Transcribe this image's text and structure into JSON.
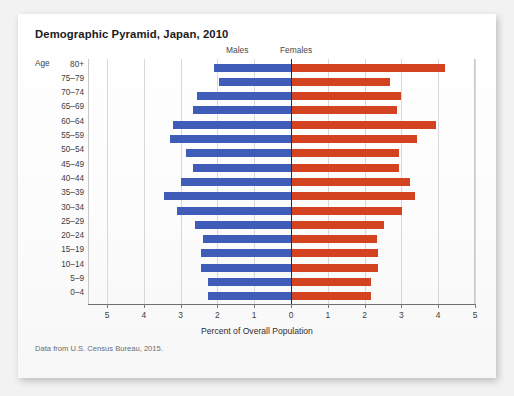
{
  "figure": {
    "title": "Demographic Pyramid, Japan, 2010",
    "source_note": "Data from U.S. Census Bureau, 2015.",
    "age_axis_title": "Age",
    "legend_left": "Males",
    "legend_right": "Females",
    "color_male": "#3f5cb8",
    "color_female": "#d3431f"
  },
  "chart_data": {
    "type": "bar",
    "orientation": "horizontal-diverging",
    "title": "Demographic Pyramid, Japan, 2010",
    "subtitle": "",
    "xlabel": "Percent of Overall Population",
    "ylabel": "Age",
    "xlim": [
      -5,
      5
    ],
    "xticks": [
      5,
      4,
      3,
      2,
      1,
      0,
      1,
      2,
      3,
      4,
      5
    ],
    "xtick_labels": [
      "5",
      "4",
      "3",
      "2",
      "1",
      "0",
      "1",
      "2",
      "3",
      "4",
      "5"
    ],
    "grid": true,
    "legend_position": "top",
    "categories": [
      "80+",
      "75–79",
      "70–74",
      "65–69",
      "60–64",
      "55–59",
      "50–54",
      "45–49",
      "40–44",
      "35–39",
      "30–34",
      "25–29",
      "20–24",
      "15–19",
      "10–14",
      "5–9",
      "0–4"
    ],
    "series": [
      {
        "name": "Males",
        "color": "#3f5cb8",
        "values": [
          2.1,
          1.95,
          2.55,
          2.65,
          3.2,
          3.3,
          2.85,
          2.65,
          3.0,
          3.45,
          3.1,
          2.6,
          2.4,
          2.45,
          2.45,
          2.25,
          2.25
        ]
      },
      {
        "name": "Females",
        "color": "#d3431f",
        "values": [
          4.15,
          2.65,
          2.95,
          2.85,
          3.9,
          3.4,
          2.9,
          2.9,
          3.2,
          3.35,
          3.0,
          2.5,
          2.3,
          2.35,
          2.35,
          2.15,
          2.15
        ]
      }
    ]
  }
}
